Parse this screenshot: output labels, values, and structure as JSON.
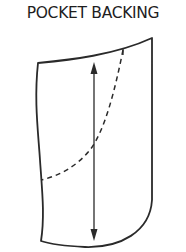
{
  "title": "POCKET BACKING",
  "diagram": {
    "elements": [
      "outline",
      "dashed-stitch-line",
      "grainline-arrow"
    ],
    "stroke_color": "#2a2a2a"
  }
}
